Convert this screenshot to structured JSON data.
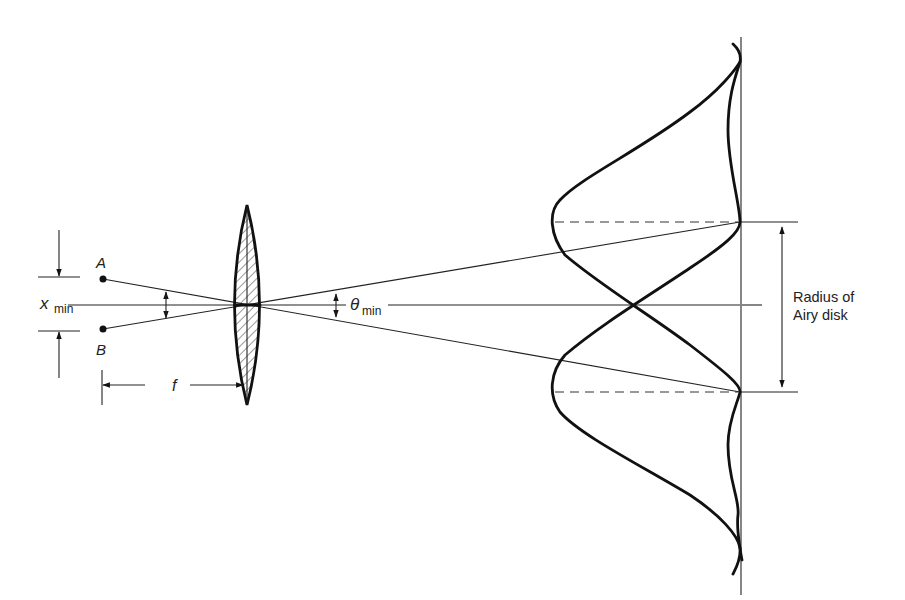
{
  "figure": {
    "labels": {
      "point_a": "A",
      "point_b": "B",
      "x_symbol": "x",
      "x_subscript": "min",
      "focal_length": "f",
      "theta_symbol": "θ",
      "theta_subscript": "min",
      "radius_line1": "Radius of",
      "radius_line2": "Airy disk"
    },
    "colors": {
      "ink": "#111111",
      "background": "#ffffff"
    }
  }
}
